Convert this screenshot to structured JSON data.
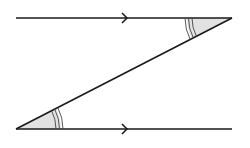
{
  "diagram": {
    "type": "parallel-lines-alternate-angles",
    "colors": {
      "line": "#1a1a1a",
      "angle_fill": "#e2e2e2",
      "arc": "#444444",
      "background": "#ffffff"
    },
    "top_line": {
      "x1": 16,
      "y1": 18,
      "x2": 232,
      "y2": 18,
      "arrow_x": 125
    },
    "bottom_line": {
      "x1": 16,
      "y1": 129,
      "x2": 232,
      "y2": 129,
      "arrow_x": 125
    },
    "transversal": {
      "x1": 16,
      "y1": 129,
      "x2": 232,
      "y2": 18
    },
    "angles": [
      {
        "name": "top-right",
        "vertex": [
          232,
          18
        ],
        "arcs": 3
      },
      {
        "name": "bottom-left",
        "vertex": [
          16,
          129
        ],
        "arcs": 3
      }
    ]
  }
}
